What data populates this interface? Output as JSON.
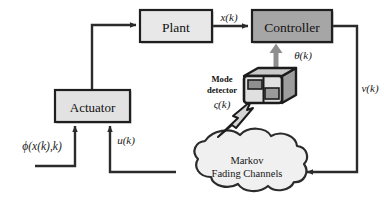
{
  "figure": {
    "type": "block-diagram",
    "background_color": "#ffffff",
    "line_color": "#2b2b2b"
  },
  "blocks": {
    "plant": {
      "label": "Plant",
      "fill": "#e8e8e8",
      "border": "#1f1f1f",
      "x": 140,
      "y": 10,
      "w": 72,
      "h": 32
    },
    "controller": {
      "label": "Controller",
      "fill": "#a6a6a6",
      "border": "#1f1f1f",
      "x": 252,
      "y": 10,
      "w": 80,
      "h": 32
    },
    "actuator": {
      "label": "Actuator",
      "fill": "#e2e2e2",
      "border": "#1f1f1f",
      "x": 55,
      "y": 90,
      "w": 75,
      "h": 32
    }
  },
  "cloud": {
    "label_line1": "Markov",
    "label_line2": "Fading Channels",
    "fill": "#f0f0f0",
    "border": "#2b2b2b"
  },
  "mode_detector": {
    "label_line1": "Mode",
    "label_line2": "detector",
    "icon_name": "mode-detector-device-icon",
    "body_fill": "#d8d8d8",
    "top_fill": "#bdbdbd",
    "outline": "#1c1c1c"
  },
  "signals": {
    "state": "x(k)",
    "mode": "θ(k)",
    "measurement": "v(k)",
    "control": "u(k)",
    "nonlinearity": "ϕ(x(k),k)",
    "detector_output": "ς(k)"
  },
  "arrows": [
    {
      "name": "actuator-to-plant",
      "from": "actuator",
      "to": "plant"
    },
    {
      "name": "plant-to-controller",
      "from": "plant",
      "to": "controller",
      "label": "x(k)"
    },
    {
      "name": "controller-to-cloud",
      "from": "controller",
      "to": "cloud",
      "label": "v(k)"
    },
    {
      "name": "cloud-to-actuator",
      "from": "cloud",
      "to": "actuator",
      "label": "u(k)"
    },
    {
      "name": "nonlinearity-to-actuator",
      "from": "external",
      "to": "actuator",
      "label": "ϕ(x(k),k)"
    },
    {
      "name": "detector-to-controller",
      "from": "mode_detector",
      "to": "controller",
      "label": "θ(k)"
    },
    {
      "name": "cloud-to-detector",
      "from": "cloud",
      "to": "mode_detector",
      "label": "ς(k)",
      "style": "lightning"
    }
  ]
}
